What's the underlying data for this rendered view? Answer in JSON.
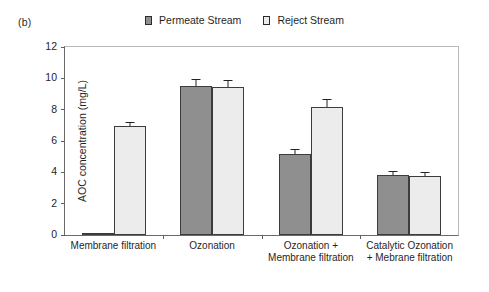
{
  "panel_label": "(b)",
  "legend": {
    "position": "top-center",
    "items": [
      {
        "label": "Permeate Stream",
        "color": "#8f8f8f",
        "icon": "filled-square-swatch"
      },
      {
        "label": "Reject Stream",
        "color": "#ececec",
        "icon": "open-square-swatch"
      }
    ]
  },
  "axes": {
    "y_title": "AOC concentration (mg/L)",
    "y_ticks": [
      "0",
      "2",
      "4",
      "6",
      "8",
      "10",
      "12"
    ],
    "x_title": ""
  },
  "chart_data": {
    "type": "bar",
    "title": "(b)",
    "xlabel": "",
    "ylabel": "AOC concentration (mg/L)",
    "ylim": [
      0,
      12
    ],
    "ytick_step": 2,
    "grid": false,
    "legend_position": "top-center",
    "categories": [
      "Membrane filtration",
      "Ozonation",
      "Ozonation + Membrane filtration",
      "Catalytic Ozonation + Mebrane filtration"
    ],
    "series": [
      {
        "name": "Permeate Stream",
        "color": "#8f8f8f",
        "values": [
          0.1,
          9.5,
          5.2,
          3.85
        ],
        "errors": [
          0.0,
          0.45,
          0.3,
          0.25
        ]
      },
      {
        "name": "Reject Stream",
        "color": "#ececec",
        "values": [
          6.95,
          9.45,
          8.2,
          3.75
        ],
        "errors": [
          0.25,
          0.45,
          0.45,
          0.25
        ]
      }
    ]
  }
}
